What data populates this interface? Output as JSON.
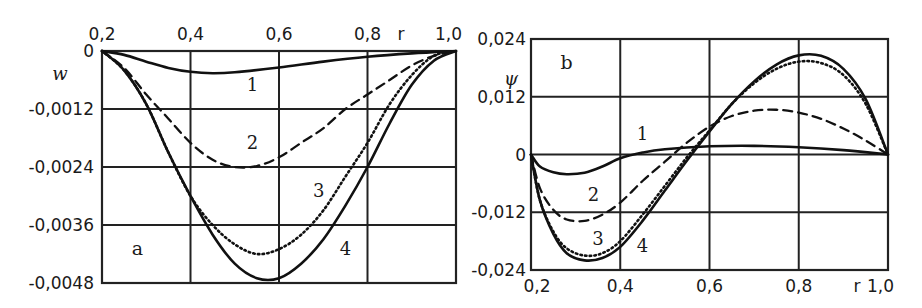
{
  "chart_data": [
    {
      "panel": "a",
      "type": "line",
      "title": "",
      "xlabel": "r",
      "ylabel": "w",
      "xlim": [
        0.2,
        1.0
      ],
      "ylim": [
        -0.0048,
        0
      ],
      "x_ticks": [
        "0,2",
        "0,4",
        "0,6",
        "0,8",
        "1,0"
      ],
      "y_ticks": [
        "0",
        "-0,0012",
        "-0,0024",
        "-0,0036",
        "-0,0048"
      ],
      "x_axis_position": "top",
      "grid": true,
      "legend": "inline curve numbers 1-4",
      "series": [
        {
          "name": "1",
          "style": "solid",
          "x": [
            0.2,
            0.25,
            0.3,
            0.35,
            0.4,
            0.45,
            0.5,
            0.6,
            0.7,
            0.8,
            0.9,
            1.0
          ],
          "values": [
            0,
            -8e-05,
            -0.00022,
            -0.00035,
            -0.00043,
            -0.00046,
            -0.00044,
            -0.00034,
            -0.00022,
            -0.00012,
            -5e-05,
            0
          ]
        },
        {
          "name": "2",
          "style": "dashed",
          "x": [
            0.2,
            0.25,
            0.3,
            0.35,
            0.4,
            0.45,
            0.5,
            0.55,
            0.6,
            0.65,
            0.7,
            0.75,
            0.8,
            0.85,
            0.9,
            0.95,
            1.0
          ],
          "values": [
            0,
            -0.00035,
            -0.0009,
            -0.0014,
            -0.0019,
            -0.00225,
            -0.0024,
            -0.00238,
            -0.0022,
            -0.0019,
            -0.0016,
            -0.0012,
            -0.0009,
            -0.0006,
            -0.0003,
            -0.0001,
            0
          ]
        },
        {
          "name": "3",
          "style": "dotted",
          "x": [
            0.2,
            0.25,
            0.3,
            0.35,
            0.4,
            0.45,
            0.5,
            0.55,
            0.6,
            0.65,
            0.7,
            0.75,
            0.8,
            0.85,
            0.9,
            0.95,
            1.0
          ],
          "values": [
            0,
            -0.0004,
            -0.0011,
            -0.0021,
            -0.003,
            -0.0036,
            -0.004,
            -0.0042,
            -0.0041,
            -0.0038,
            -0.0033,
            -0.0026,
            -0.0019,
            -0.0011,
            -0.0005,
            -0.0001,
            0
          ]
        },
        {
          "name": "4",
          "style": "solid",
          "x": [
            0.2,
            0.25,
            0.3,
            0.35,
            0.4,
            0.45,
            0.5,
            0.55,
            0.6,
            0.65,
            0.7,
            0.75,
            0.8,
            0.85,
            0.9,
            0.95,
            1.0
          ],
          "values": [
            0,
            -0.0004,
            -0.0011,
            -0.0021,
            -0.003,
            -0.0038,
            -0.0044,
            -0.0047,
            -0.0047,
            -0.0044,
            -0.0039,
            -0.0032,
            -0.0024,
            -0.0015,
            -0.0007,
            -0.0002,
            0
          ]
        }
      ],
      "annotations": [
        {
          "text": "1",
          "x": 0.54,
          "y": -0.0007
        },
        {
          "text": "2",
          "x": 0.54,
          "y": -0.0019
        },
        {
          "text": "3",
          "x": 0.69,
          "y": -0.0029
        },
        {
          "text": "4",
          "x": 0.75,
          "y": -0.0041
        },
        {
          "text": "a",
          "x": 0.28,
          "y": -0.0041
        }
      ]
    },
    {
      "panel": "b",
      "type": "line",
      "title": "",
      "xlabel": "r",
      "ylabel": "ψ",
      "xlim": [
        0.2,
        1.0
      ],
      "ylim": [
        -0.024,
        0.024
      ],
      "x_ticks": [
        "0,2",
        "0,4",
        "0,6",
        "0,8",
        "1,0"
      ],
      "y_ticks": [
        "0,024",
        "0,012",
        "0",
        "-0,012",
        "-0,024"
      ],
      "x_axis_position": "bottom",
      "grid": true,
      "legend": "inline curve numbers 1-4",
      "series": [
        {
          "name": "1",
          "style": "solid",
          "x": [
            0.2,
            0.22,
            0.25,
            0.28,
            0.32,
            0.36,
            0.4,
            0.45,
            0.5,
            0.6,
            0.7,
            0.8,
            0.9,
            1.0
          ],
          "values": [
            0,
            -0.0025,
            -0.0037,
            -0.0041,
            -0.0038,
            -0.0025,
            -0.0008,
            0.0004,
            0.0011,
            0.0017,
            0.0018,
            0.0015,
            0.0009,
            0
          ]
        },
        {
          "name": "2",
          "style": "dashed",
          "x": [
            0.2,
            0.22,
            0.25,
            0.28,
            0.32,
            0.36,
            0.4,
            0.45,
            0.5,
            0.55,
            0.6,
            0.65,
            0.7,
            0.75,
            0.8,
            0.85,
            0.9,
            0.95,
            1.0
          ],
          "values": [
            0,
            -0.007,
            -0.0115,
            -0.0135,
            -0.0138,
            -0.0125,
            -0.01,
            -0.0055,
            -0.0015,
            0.0025,
            0.0058,
            0.008,
            0.0091,
            0.0093,
            0.0087,
            0.0074,
            0.0054,
            0.0029,
            0
          ]
        },
        {
          "name": "3",
          "style": "dotted",
          "x": [
            0.2,
            0.22,
            0.25,
            0.28,
            0.32,
            0.36,
            0.4,
            0.45,
            0.5,
            0.55,
            0.6,
            0.65,
            0.7,
            0.75,
            0.8,
            0.85,
            0.9,
            0.95,
            1.0
          ],
          "values": [
            0,
            -0.0095,
            -0.016,
            -0.0195,
            -0.021,
            -0.0205,
            -0.018,
            -0.0125,
            -0.0065,
            -0.0005,
            0.005,
            0.0105,
            0.0148,
            0.0178,
            0.0193,
            0.019,
            0.0165,
            0.0105,
            0
          ]
        },
        {
          "name": "4",
          "style": "solid",
          "x": [
            0.2,
            0.22,
            0.25,
            0.28,
            0.32,
            0.36,
            0.4,
            0.45,
            0.5,
            0.55,
            0.6,
            0.65,
            0.7,
            0.75,
            0.8,
            0.85,
            0.9,
            0.95,
            1.0
          ],
          "values": [
            0,
            -0.0095,
            -0.0165,
            -0.0205,
            -0.022,
            -0.0215,
            -0.0192,
            -0.0138,
            -0.0075,
            -0.0012,
            0.0048,
            0.0105,
            0.0152,
            0.0187,
            0.0206,
            0.0205,
            0.0178,
            0.0115,
            0
          ]
        }
      ],
      "annotations": [
        {
          "text": "1",
          "x": 0.45,
          "y": 0.0043
        },
        {
          "text": "2",
          "x": 0.34,
          "y": -0.0085
        },
        {
          "text": "3",
          "x": 0.35,
          "y": -0.0175
        },
        {
          "text": "4",
          "x": 0.45,
          "y": -0.019
        },
        {
          "text": "b",
          "x": 0.28,
          "y": 0.019
        }
      ]
    }
  ]
}
